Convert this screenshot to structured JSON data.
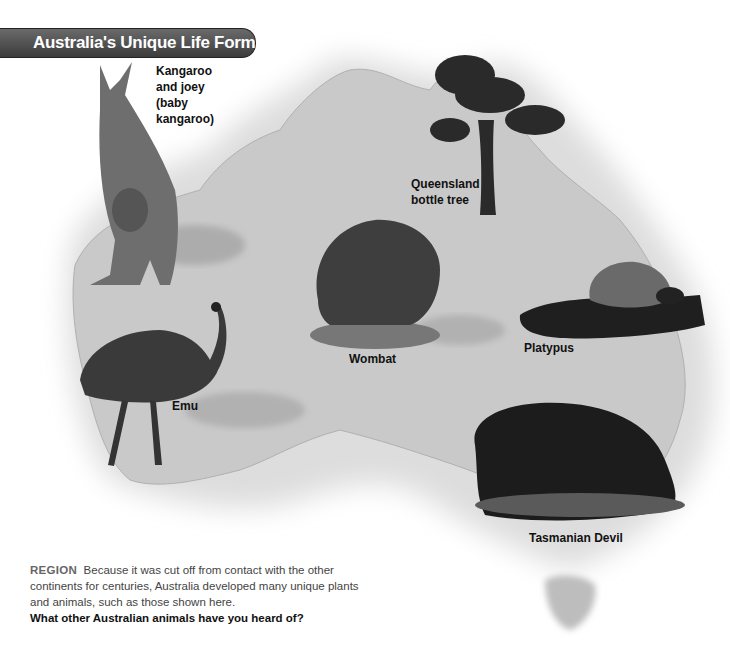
{
  "title": "Australia's Unique Life Forms",
  "labels": {
    "kangaroo": [
      "Kangaroo",
      "and joey",
      "(baby",
      "kangaroo)"
    ],
    "bottle_tree": [
      "Queensland",
      "bottle tree"
    ],
    "wombat": "Wombat",
    "platypus": "Platypus",
    "emu": "Emu",
    "tasmanian_devil": "Tasmanian Devil"
  },
  "caption": {
    "keyword": "REGION",
    "text": "Because it was cut off from contact with the other continents for centuries, Australia developed many unique plants and animals, such as those shown here.",
    "question": "What other Australian animals have you heard of?"
  },
  "colors": {
    "title_bar": "#4a4a4a",
    "map_fill": "#c8c8c8",
    "text": "#111111"
  }
}
